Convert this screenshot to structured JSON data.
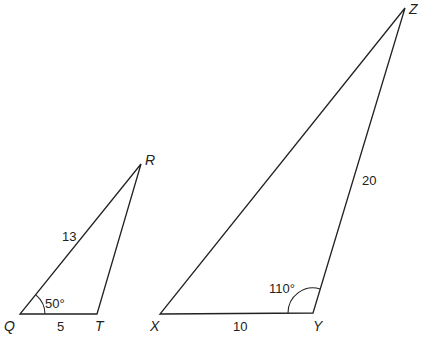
{
  "diagram": {
    "stroke_color": "#222222",
    "background": "#ffffff",
    "triangle_qrt": {
      "vertices": {
        "Q": {
          "label": "Q",
          "x": 20,
          "y": 314
        },
        "T": {
          "label": "T",
          "x": 97,
          "y": 314
        },
        "R": {
          "label": "R",
          "x": 141,
          "y": 164
        }
      },
      "side_QR": "13",
      "side_QT": "5",
      "angle_Q": "50°"
    },
    "triangle_xyz": {
      "vertices": {
        "X": {
          "label": "X",
          "x": 160,
          "y": 314
        },
        "Y": {
          "label": "Y",
          "x": 313,
          "y": 313
        },
        "Z": {
          "label": "Z",
          "x": 405,
          "y": 8
        }
      },
      "side_XY": "10",
      "side_YZ": "20",
      "angle_Y": "110°"
    }
  }
}
